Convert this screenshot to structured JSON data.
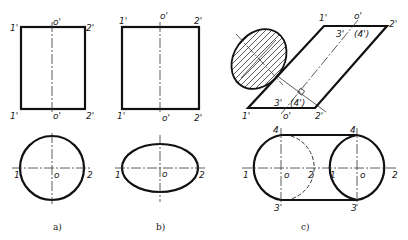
{
  "figures": [
    {
      "id": "a",
      "caption": "a)",
      "front_view": {
        "top_labels": [
          "1'",
          "o'",
          "2'"
        ],
        "bottom_labels": [
          "1'",
          "o'",
          "2'"
        ]
      },
      "top_view": {
        "shape": "circle",
        "labels": [
          "1",
          "o",
          "2"
        ]
      }
    },
    {
      "id": "b",
      "caption": "b)",
      "front_view": {
        "top_labels": [
          "1'",
          "o'",
          "2'"
        ],
        "bottom_labels": [
          "1'",
          "o'",
          "2'"
        ]
      },
      "top_view": {
        "shape": "ellipse",
        "labels": [
          "1",
          "o",
          "2"
        ]
      }
    },
    {
      "id": "c",
      "caption": "c)",
      "front_view": {
        "shape": "oblique parallelogram with hatched elliptical section",
        "top_labels": [
          "1'",
          "o'",
          "2'"
        ],
        "top_inner_labels": [
          "3'",
          "(4')"
        ],
        "bottom_labels": [
          "1'",
          "o'",
          "2'"
        ],
        "bottom_inner_labels": [
          "3'",
          "(4')"
        ]
      },
      "top_view": {
        "shape": "stadium with two circles",
        "left_labels": [
          "4",
          "1",
          "o",
          "2",
          "3"
        ],
        "right_labels": [
          "4",
          "1",
          "o",
          "2",
          "3"
        ]
      }
    }
  ]
}
